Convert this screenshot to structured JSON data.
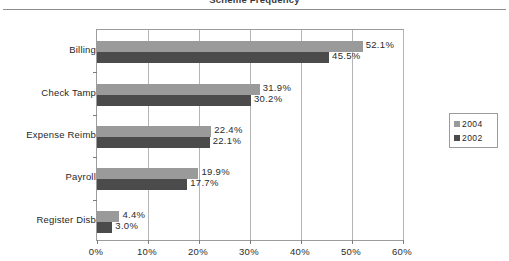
{
  "chart_data": {
    "type": "bar",
    "orientation": "horizontal",
    "title": "Scheme Frequency",
    "categories": [
      "Billing",
      "Check Tamp",
      "Expense Reimb",
      "Payroll",
      "Register  Disb"
    ],
    "series": [
      {
        "name": "2004",
        "color": "#9a9a9a",
        "values": [
          52.1,
          31.9,
          22.4,
          19.9,
          4.4
        ],
        "labels": [
          "52.1%",
          "31.9%",
          "22.4%",
          "19.9%",
          "4.4%"
        ]
      },
      {
        "name": "2002",
        "color": "#4b4b4b",
        "values": [
          45.5,
          30.2,
          22.1,
          17.7,
          3.0
        ],
        "labels": [
          "45.5%",
          "30.2%",
          "22.1%",
          "17.7%",
          "3.0%"
        ]
      }
    ],
    "xlabel": "",
    "ylabel": "",
    "xlim": [
      0,
      60
    ],
    "xticks": [
      0,
      10,
      20,
      30,
      40,
      50,
      60
    ],
    "xticklabels": [
      "0%",
      "10%",
      "20%",
      "30%",
      "40%",
      "50%",
      "60%"
    ],
    "grid": "vertical",
    "legend_position": "right",
    "legend_entries": [
      "2004",
      "2002"
    ]
  }
}
